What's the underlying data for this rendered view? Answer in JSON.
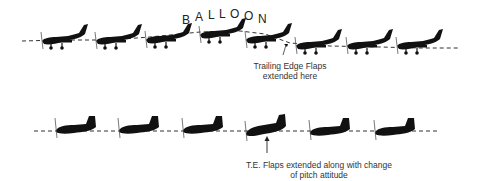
{
  "diagram": {
    "top_sequence": {
      "label": "BALLOON",
      "label_letters": [
        "B",
        "A",
        "L",
        "L",
        "O",
        "O",
        "N"
      ],
      "caption_line1": "Trailing Edge Flaps",
      "caption_line2": "extended here",
      "aircraft_count": 8,
      "aircraft_style": "low-wing light aircraft with fixed landing gear"
    },
    "bottom_sequence": {
      "caption_line1": "T.E. Flaps extended along with change",
      "caption_line2": "of pitch attitude",
      "aircraft_count": 6,
      "aircraft_style": "low-wing aircraft, gear retracted"
    },
    "colors": {
      "ink": "#111111",
      "text": "#333333",
      "background": "#ffffff"
    }
  }
}
